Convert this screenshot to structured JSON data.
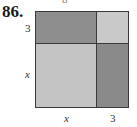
{
  "problem_number": "86.",
  "top_cutoff_glyph": "8",
  "diagram": {
    "type": "area-model-square",
    "regions": [
      {
        "name": "top-left",
        "label": "3x",
        "color": "#8e8e8e"
      },
      {
        "name": "top-right",
        "label": "9",
        "color": "#c9c9c9"
      },
      {
        "name": "bottom-left",
        "label": "x^2",
        "color": "#c4c4c4"
      },
      {
        "name": "bottom-right",
        "label": "3x",
        "color": "#8a8a8a"
      }
    ],
    "left_labels": [
      "3",
      "x"
    ],
    "bottom_labels": [
      "x",
      "3"
    ],
    "border_color": "#3a3a3a"
  }
}
